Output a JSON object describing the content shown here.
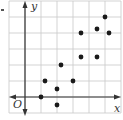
{
  "chart_data": {
    "type": "scatter",
    "title": "",
    "xlabel": "x",
    "ylabel": "y",
    "origin_label": "O",
    "xlim": [
      -1,
      6
    ],
    "ylim": [
      -1,
      6
    ],
    "grid": true,
    "grid_step": 1,
    "x_ticks_labeled": false,
    "y_ticks_labeled": false,
    "legend": null,
    "points": [
      {
        "x": 1,
        "y": 0
      },
      {
        "x": 1.25,
        "y": 1
      },
      {
        "x": 2,
        "y": 0.5
      },
      {
        "x": 2,
        "y": -0.5
      },
      {
        "x": 2.25,
        "y": 2
      },
      {
        "x": 3,
        "y": 1
      },
      {
        "x": 3.5,
        "y": 2.5
      },
      {
        "x": 3.5,
        "y": 4
      },
      {
        "x": 4.5,
        "y": 2.5
      },
      {
        "x": 4.5,
        "y": 4.25
      },
      {
        "x": 5,
        "y": 5
      },
      {
        "x": 5.25,
        "y": 4
      }
    ]
  },
  "colors": {
    "grid": "#c8c8c8",
    "axis": "#333333",
    "point": "#1a1a1a"
  }
}
